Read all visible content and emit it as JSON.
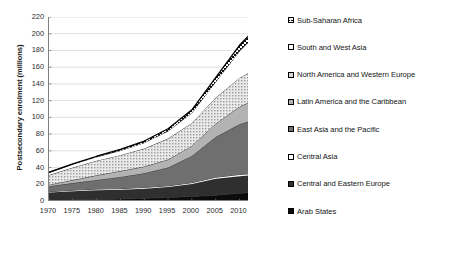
{
  "chart_data": {
    "type": "area",
    "stacked": true,
    "title": "",
    "subtitle": "",
    "xlabel": "",
    "ylabel": "Postsecondary enrolment (millions)",
    "xlim": [
      1970,
      2012
    ],
    "ylim": [
      0,
      220
    ],
    "ytick_step": 20,
    "grid": true,
    "grid_axis": "y",
    "legend_position": "right",
    "x": [
      1970,
      1975,
      1980,
      1985,
      1990,
      1995,
      2000,
      2005,
      2010,
      2012
    ],
    "xticks": [
      "1970",
      "1975",
      "1980",
      "1985",
      "1990",
      "1995",
      "2000",
      "2005",
      "2010"
    ],
    "yticks": [
      "0",
      "20",
      "40",
      "60",
      "80",
      "100",
      "120",
      "140",
      "160",
      "180",
      "200",
      "220"
    ],
    "series": [
      {
        "name": "Arab States",
        "fill": "#0b0b0b",
        "pattern": "solid-black",
        "values": [
          0.7,
          1.2,
          1.8,
          2.4,
          3.2,
          4.2,
          5.4,
          7.0,
          9.2,
          10.0
        ]
      },
      {
        "name": "Central and Eastern Europe",
        "fill": "#2f2f2f",
        "pattern": "solid-dark-gray",
        "values": [
          9.5,
          10.5,
          11.0,
          11.0,
          11.5,
          12.5,
          15.0,
          19.5,
          20.5,
          20.5
        ]
      },
      {
        "name": "Central Asia",
        "fill": "#fdfdfd",
        "pattern": "solid-white",
        "values": [
          1.0,
          1.2,
          1.4,
          1.4,
          1.5,
          1.4,
          1.5,
          1.9,
          2.0,
          2.0
        ]
      },
      {
        "name": "East Asia and the Pacific",
        "fill": "#6f6f6f",
        "pattern": "solid-mid-gray",
        "values": [
          6.5,
          8.5,
          11.0,
          14.0,
          17.0,
          22.0,
          32.0,
          48.0,
          60.0,
          63.0
        ]
      },
      {
        "name": "Latin America and the Caribbean",
        "fill": "#b3b3b3",
        "pattern": "solid-light-gray",
        "values": [
          1.8,
          3.6,
          5.5,
          7.0,
          8.0,
          9.5,
          12.0,
          16.0,
          21.0,
          22.5
        ]
      },
      {
        "name": "North America and Western Europe",
        "fill": "#cccccc",
        "pattern": "fine-dots",
        "values": [
          11.5,
          15.0,
          17.5,
          19.0,
          21.5,
          25.0,
          27.5,
          31.0,
          34.5,
          35.5
        ]
      },
      {
        "name": "South and West Asia",
        "fill": "#ffffff",
        "pattern": "open-white",
        "values": [
          3.0,
          4.0,
          4.5,
          5.5,
          7.0,
          9.0,
          12.0,
          19.0,
          32.0,
          37.0
        ]
      },
      {
        "name": "Sub-Saharan Africa",
        "fill": "#e6e6e6",
        "pattern": "cross-hatch",
        "values": [
          0.3,
          0.5,
          0.8,
          1.3,
          2.0,
          2.8,
          3.6,
          5.0,
          7.0,
          7.5
        ]
      }
    ],
    "totals": [
      34.3,
      44.5,
      53.5,
      61.6,
      71.7,
      86.4,
      109.0,
      147.4,
      186.2,
      198.0
    ]
  },
  "legend": {
    "items": [
      {
        "label": "Sub-Saharan Africa",
        "swatch": "cross-hatch"
      },
      {
        "label": "South and West Asia",
        "swatch": "open-white"
      },
      {
        "label": "North America and Western Europe",
        "swatch": "fine-dots"
      },
      {
        "label": "Latin America and the Caribbean",
        "swatch": "solid-light-gray"
      },
      {
        "label": "East Asia and the Pacific",
        "swatch": "solid-mid-gray"
      },
      {
        "label": "Central Asia",
        "swatch": "solid-white"
      },
      {
        "label": "Central and Eastern Europe",
        "swatch": "solid-dark-gray"
      },
      {
        "label": "Arab States",
        "swatch": "solid-black"
      }
    ]
  }
}
